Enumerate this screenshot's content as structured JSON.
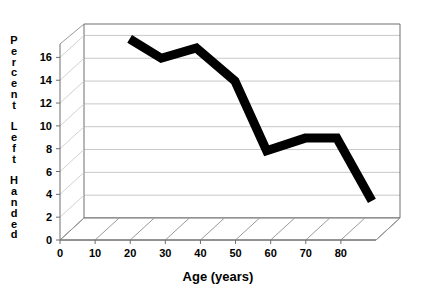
{
  "chart_data": {
    "type": "line",
    "title": "",
    "subtitle": "",
    "xlabel": "Age (years)",
    "ylabel": "Percent Left Handed",
    "ylabel_chars": [
      "P",
      "e",
      "r",
      "c",
      "e",
      "n",
      "t",
      "",
      "L",
      "e",
      "f",
      "t",
      "",
      "H",
      "a",
      "n",
      "d",
      "e",
      "d"
    ],
    "xlim": [
      0,
      90
    ],
    "ylim": [
      0,
      17
    ],
    "xticks": [
      0,
      10,
      20,
      30,
      40,
      50,
      60,
      70,
      80
    ],
    "xtick_labels": [
      "0",
      "10",
      "20",
      "30",
      "40",
      "50",
      "60",
      "70",
      "80"
    ],
    "yticks": [
      0,
      2,
      4,
      6,
      8,
      10,
      12,
      14,
      16
    ],
    "ytick_labels": [
      "0",
      "2",
      "4",
      "6",
      "8",
      "10",
      "12",
      "14",
      "16"
    ],
    "grid": "horizontal",
    "legend": "none",
    "style": "3d-perspective",
    "series": [
      {
        "name": "Percent Left Handed",
        "color": "#000000",
        "line_width": 9,
        "x": [
          13,
          22,
          32,
          43,
          52,
          63,
          72,
          82
        ],
        "values": [
          15.7,
          14.0,
          14.9,
          12.0,
          5.9,
          7.0,
          7.0,
          1.5
        ]
      }
    ],
    "colors": {
      "line": "#000000",
      "gridline": "#c8c8c8",
      "axis": "#808080",
      "frame": "#666666",
      "background": "#ffffff",
      "text": "#000000"
    }
  },
  "axes": {
    "x_axis_title": "Age (years)",
    "y_axis_title": "Percent Left Handed"
  }
}
